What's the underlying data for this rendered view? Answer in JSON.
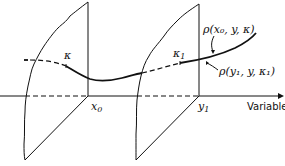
{
  "diagram": {
    "axis_label": "Variable",
    "points": [
      {
        "name": "x0",
        "label": "x",
        "subscript": "0"
      },
      {
        "name": "y1",
        "label": "y",
        "subscript": "1"
      }
    ],
    "curve_labels": {
      "kappa": "κ",
      "kappa1": "κ",
      "kappa1_sub": "1",
      "upper": "ρ(x₀, y, κ)",
      "lower": "ρ(y₁, y, κ₁)"
    }
  }
}
